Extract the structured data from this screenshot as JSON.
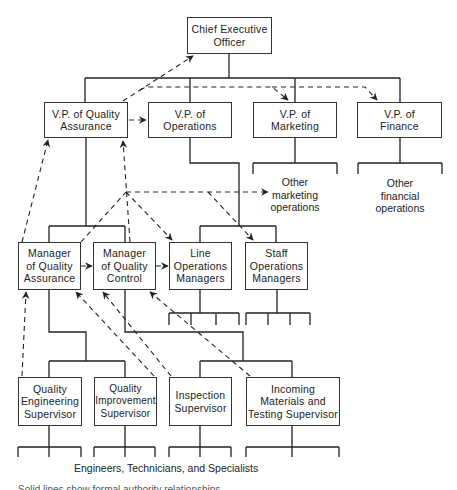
{
  "diagram": {
    "type": "organization-chart",
    "nodes": {
      "ceo": "Chief Executive\nOfficer",
      "vp_quality": "V.P. of Quality\nAssurance",
      "vp_operations": "V.P. of\nOperations",
      "vp_marketing": "V.P. of\nMarketing",
      "vp_finance": "V.P. of\nFinance",
      "mgr_quality_assurance": "Manager\nof Quality\nAssurance",
      "mgr_quality_control": "Manager\nof Quality\nControl",
      "line_ops_managers": "Line\nOperations\nManagers",
      "staff_ops_managers": "Staff\nOperations\nManagers",
      "quality_engineering_supervisor": "Quality\nEngineering\nSupervisor",
      "quality_improvement_supervisor": "Quality\nImprovement\nSupervisor",
      "inspection_supervisor": "Inspection\nSupervisor",
      "incoming_materials_supervisor": "Incoming\nMaterials and\nTesting Supervisor"
    },
    "labels": {
      "other_marketing": "Other\nmarketing\noperations",
      "other_financial": "Other\nfinancial\noperations",
      "bottom_caption": "Engineers, Technicians, and Specialists",
      "legend_cut": "Solid lines show formal authority relationships"
    },
    "edges_solid": [
      [
        "ceo",
        "vp_quality"
      ],
      [
        "ceo",
        "vp_operations"
      ],
      [
        "ceo",
        "vp_marketing"
      ],
      [
        "ceo",
        "vp_finance"
      ],
      [
        "vp_quality",
        "mgr_quality_assurance"
      ],
      [
        "vp_quality",
        "mgr_quality_control"
      ],
      [
        "vp_operations",
        "line_ops_managers"
      ],
      [
        "vp_operations",
        "staff_ops_managers"
      ],
      [
        "mgr_quality_assurance",
        "quality_engineering_supervisor"
      ],
      [
        "mgr_quality_assurance",
        "quality_improvement_supervisor"
      ],
      [
        "mgr_quality_control",
        "inspection_supervisor"
      ],
      [
        "mgr_quality_control",
        "incoming_materials_supervisor"
      ]
    ],
    "edges_dashed": [
      [
        "vp_quality",
        "ceo"
      ],
      [
        "vp_quality",
        "vp_operations"
      ],
      [
        "vp_quality",
        "vp_marketing"
      ],
      [
        "vp_quality",
        "vp_finance"
      ],
      [
        "mgr_quality_assurance",
        "vp_quality"
      ],
      [
        "mgr_quality_control",
        "vp_quality"
      ],
      [
        "hub",
        "line_ops_managers"
      ],
      [
        "hub",
        "staff_ops_managers"
      ],
      [
        "hub",
        "other_marketing"
      ],
      [
        "mgr_quality_assurance",
        "mgr_quality_control"
      ],
      [
        "mgr_quality_control",
        "line_ops_managers"
      ],
      [
        "quality_engineering_supervisor",
        "mgr_quality_assurance"
      ],
      [
        "quality_improvement_supervisor",
        "mgr_quality_assurance"
      ],
      [
        "inspection_supervisor",
        "mgr_quality_control"
      ],
      [
        "incoming_materials_supervisor",
        "mgr_quality_control"
      ]
    ]
  }
}
